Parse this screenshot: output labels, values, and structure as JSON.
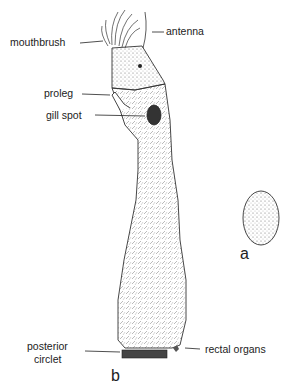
{
  "labels": {
    "mouthbrush": "mouthbrush",
    "antenna": "antenna",
    "proleg": "proleg",
    "gill_spot": "gill spot",
    "posterior_circlet_1": "posterior",
    "posterior_circlet_2": "circlet",
    "rectal_organs": "rectal organs"
  },
  "figure_letters": {
    "a": "a",
    "b": "b"
  },
  "colors": {
    "ink": "#222222",
    "background": "#ffffff"
  }
}
